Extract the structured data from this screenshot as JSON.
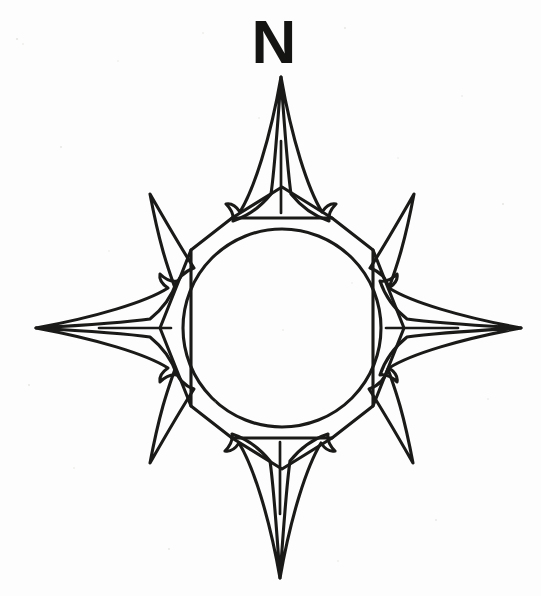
{
  "document": {
    "title": "Compass Rose",
    "kind": "line-drawing",
    "background_color": "#fdfdfd",
    "ink_color": "#1a1a18"
  },
  "labels": {
    "north": "N"
  },
  "compass": {
    "center": {
      "x": 282,
      "y": 328
    },
    "circle_radius": 99,
    "octagon_radius": 118,
    "cardinal_points": [
      {
        "name": "north",
        "tip_x": 281,
        "tip_y": 77
      },
      {
        "name": "east",
        "tip_x": 521,
        "tip_y": 328
      },
      {
        "name": "south",
        "tip_x": 280,
        "tip_y": 578
      },
      {
        "name": "west",
        "tip_x": 36,
        "tip_y": 328
      }
    ],
    "ordinal_points": [
      {
        "name": "northeast",
        "tip_x": 414,
        "tip_y": 194
      },
      {
        "name": "southeast",
        "tip_x": 413,
        "tip_y": 463
      },
      {
        "name": "southwest",
        "tip_x": 150,
        "tip_y": 463
      },
      {
        "name": "northwest",
        "tip_x": 150,
        "tip_y": 194
      }
    ]
  }
}
